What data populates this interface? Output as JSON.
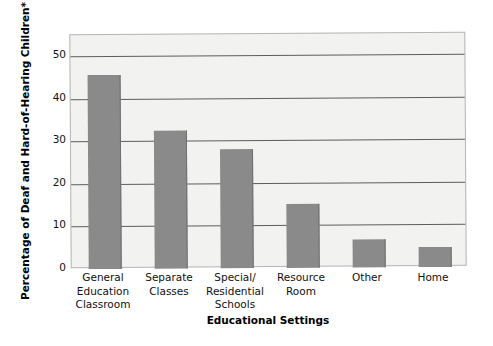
{
  "chart_data": {
    "type": "bar",
    "title": "",
    "xlabel": "Educational Settings",
    "ylabel": "Percentage of Deaf and Hard-of-Hearing Children*",
    "categories": [
      "General\nEducation\nClassroom",
      "Separate\nClasses",
      "Special/\nResidential\nSchools",
      "Resource\nRoom",
      "Other",
      "Home"
    ],
    "category_labels": [
      [
        "General",
        "Education",
        "Classroom"
      ],
      [
        "Separate",
        "Classes"
      ],
      [
        "Special/",
        "Residential",
        "Schools"
      ],
      [
        "Resource",
        "Room"
      ],
      [
        "Other"
      ],
      [
        "Home"
      ]
    ],
    "values": [
      45.5,
      32.5,
      28,
      15,
      6.5,
      4.8
    ],
    "ylim": [
      0,
      55
    ],
    "yticks": [
      0,
      10,
      20,
      30,
      40,
      50
    ],
    "ytick_labels": [
      "0",
      "10",
      "20",
      "30",
      "40",
      "50"
    ],
    "gridlines": [
      10,
      20,
      30,
      40,
      50
    ],
    "grid": true,
    "legend": null,
    "legend_position": "none",
    "bar_color": "#8a8a8a",
    "plot_background": "#f2f2f0",
    "gridline_color": "#5d5d5d",
    "axis_border_color": "#b5b5b5",
    "page_background": "#ffffff"
  }
}
